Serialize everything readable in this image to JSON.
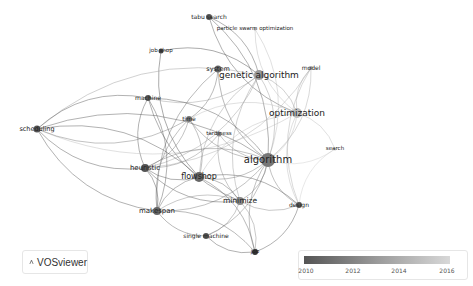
{
  "app": {
    "name": "VOSviewer"
  },
  "legend": {
    "type": "overlay-timeline",
    "ticks": [
      "2010",
      "2012",
      "2014",
      "2016"
    ],
    "gradient_start": "#555555",
    "gradient_end": "#d8d8d8"
  },
  "network": {
    "nodes": [
      {
        "id": "tabu",
        "label": "tabu search",
        "x": 209,
        "y": 17,
        "size": 3,
        "fs": 6,
        "color": "#555"
      },
      {
        "id": "pso",
        "label": "particle swarm optimization",
        "x": 255,
        "y": 29,
        "size": 1.5,
        "fs": 5.5,
        "color": "#bbb"
      },
      {
        "id": "jobshop",
        "label": "job shop",
        "x": 161,
        "y": 51,
        "size": 2.5,
        "fs": 5.5,
        "color": "#444"
      },
      {
        "id": "system",
        "label": "system",
        "x": 218,
        "y": 69,
        "size": 3.5,
        "fs": 6.5,
        "color": "#666"
      },
      {
        "id": "ga",
        "label": "genetic algorithm",
        "x": 259,
        "y": 75,
        "size": 5,
        "fs": 9,
        "color": "#999"
      },
      {
        "id": "model",
        "label": "model",
        "x": 311,
        "y": 68,
        "size": 2,
        "fs": 6,
        "color": "#aaa"
      },
      {
        "id": "machine",
        "label": "machine",
        "x": 148,
        "y": 98,
        "size": 3,
        "fs": 6,
        "color": "#555"
      },
      {
        "id": "optimization",
        "label": "optimization",
        "x": 297,
        "y": 113,
        "size": 5,
        "fs": 9,
        "color": "#bbb"
      },
      {
        "id": "time",
        "label": "time",
        "x": 189,
        "y": 119,
        "size": 3,
        "fs": 6,
        "color": "#777"
      },
      {
        "id": "scheduling",
        "label": "scheduling",
        "x": 37,
        "y": 129,
        "size": 3.5,
        "fs": 6.5,
        "color": "#555"
      },
      {
        "id": "tardiness",
        "label": "tardiness",
        "x": 219,
        "y": 134,
        "size": 2.5,
        "fs": 5.5,
        "color": "#888"
      },
      {
        "id": "search",
        "label": "search",
        "x": 335,
        "y": 149,
        "size": 1.5,
        "fs": 5.5,
        "color": "#ccc"
      },
      {
        "id": "algorithm",
        "label": "algorithm",
        "x": 268,
        "y": 160,
        "size": 7,
        "fs": 10,
        "color": "#777"
      },
      {
        "id": "heuristic",
        "label": "heuristic",
        "x": 145,
        "y": 168,
        "size": 4,
        "fs": 7,
        "color": "#555"
      },
      {
        "id": "flowshop",
        "label": "flowshop",
        "x": 199,
        "y": 177,
        "size": 5,
        "fs": 8,
        "color": "#666"
      },
      {
        "id": "minimize",
        "label": "minimize",
        "x": 240,
        "y": 201,
        "size": 4,
        "fs": 7.5,
        "color": "#888"
      },
      {
        "id": "design",
        "label": "design",
        "x": 299,
        "y": 205,
        "size": 3,
        "fs": 6,
        "color": "#555"
      },
      {
        "id": "makespan",
        "label": "makespan",
        "x": 157,
        "y": 211,
        "size": 4,
        "fs": 7,
        "color": "#666"
      },
      {
        "id": "singlemachine",
        "label": "single machine",
        "x": 206,
        "y": 236,
        "size": 3,
        "fs": 6,
        "color": "#555"
      },
      {
        "id": "job",
        "label": "job",
        "x": 255,
        "y": 252,
        "size": 3,
        "fs": 5.5,
        "color": "#333"
      }
    ],
    "edges": [
      [
        "tabu",
        "algorithm"
      ],
      [
        "tabu",
        "optimization"
      ],
      [
        "tabu",
        "ga"
      ],
      [
        "pso",
        "optimization"
      ],
      [
        "pso",
        "algorithm"
      ],
      [
        "jobshop",
        "flowshop"
      ],
      [
        "jobshop",
        "ga"
      ],
      [
        "system",
        "algorithm"
      ],
      [
        "system",
        "time"
      ],
      [
        "system",
        "makespan"
      ],
      [
        "ga",
        "algorithm"
      ],
      [
        "ga",
        "flowshop"
      ],
      [
        "ga",
        "machine"
      ],
      [
        "ga",
        "scheduling"
      ],
      [
        "ga",
        "optimization"
      ],
      [
        "ga",
        "minimize"
      ],
      [
        "ga",
        "heuristic"
      ],
      [
        "model",
        "optimization"
      ],
      [
        "model",
        "algorithm"
      ],
      [
        "model",
        "design"
      ],
      [
        "model",
        "heuristic"
      ],
      [
        "machine",
        "scheduling"
      ],
      [
        "machine",
        "algorithm"
      ],
      [
        "machine",
        "minimize"
      ],
      [
        "machine",
        "makespan"
      ],
      [
        "machine",
        "heuristic"
      ],
      [
        "optimization",
        "algorithm"
      ],
      [
        "optimization",
        "design"
      ],
      [
        "optimization",
        "search"
      ],
      [
        "optimization",
        "time"
      ],
      [
        "optimization",
        "scheduling"
      ],
      [
        "optimization",
        "flowshop"
      ],
      [
        "time",
        "flowshop"
      ],
      [
        "time",
        "algorithm"
      ],
      [
        "time",
        "heuristic"
      ],
      [
        "time",
        "makespan"
      ],
      [
        "time",
        "scheduling"
      ],
      [
        "scheduling",
        "heuristic"
      ],
      [
        "scheduling",
        "algorithm"
      ],
      [
        "scheduling",
        "makespan"
      ],
      [
        "scheduling",
        "flowshop"
      ],
      [
        "tardiness",
        "algorithm"
      ],
      [
        "tardiness",
        "heuristic"
      ],
      [
        "tardiness",
        "minimize"
      ],
      [
        "search",
        "algorithm"
      ],
      [
        "search",
        "design"
      ],
      [
        "algorithm",
        "flowshop"
      ],
      [
        "algorithm",
        "heuristic"
      ],
      [
        "algorithm",
        "minimize"
      ],
      [
        "algorithm",
        "design"
      ],
      [
        "algorithm",
        "makespan"
      ],
      [
        "algorithm",
        "job"
      ],
      [
        "algorithm",
        "singlemachine"
      ],
      [
        "heuristic",
        "flowshop"
      ],
      [
        "heuristic",
        "makespan"
      ],
      [
        "heuristic",
        "minimize"
      ],
      [
        "flowshop",
        "minimize"
      ],
      [
        "flowshop",
        "makespan"
      ],
      [
        "flowshop",
        "job"
      ],
      [
        "minimize",
        "makespan"
      ],
      [
        "minimize",
        "job"
      ],
      [
        "minimize",
        "design"
      ],
      [
        "minimize",
        "singlemachine"
      ],
      [
        "makespan",
        "singlemachine"
      ],
      [
        "makespan",
        "job"
      ],
      [
        "singlemachine",
        "job"
      ],
      [
        "design",
        "job"
      ],
      [
        "design",
        "flowshop"
      ]
    ]
  }
}
